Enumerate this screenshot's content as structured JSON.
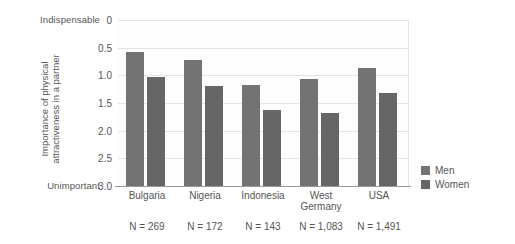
{
  "axis": {
    "top_endcap": "Indispensable",
    "bottom_endcap": "Unimportant",
    "y_title_line1": "Importance of physical",
    "y_title_line2": "attractiveness in a partner",
    "ticks": [
      "3.0",
      "2.5",
      "2.0",
      "1.5",
      "1.0",
      "0.5",
      "0"
    ]
  },
  "legend": {
    "men_label": "Men",
    "women_label": "Women",
    "men_color": "#737373",
    "women_color": "#666666"
  },
  "categories": [
    {
      "name_line1": "Bulgaria",
      "name_line2": "",
      "n": "N = 269"
    },
    {
      "name_line1": "Nigeria",
      "name_line2": "",
      "n": "N = 172"
    },
    {
      "name_line1": "Indonesia",
      "name_line2": "",
      "n": "N = 143"
    },
    {
      "name_line1": "West",
      "name_line2": "Germany",
      "n": "N = 1,083"
    },
    {
      "name_line1": "USA",
      "name_line2": "",
      "n": "N = 1,491"
    }
  ],
  "chart_data": {
    "type": "bar",
    "title": "",
    "xlabel": "",
    "ylabel": "Importance of physical attractiveness in a partner",
    "ylim": [
      0,
      3.0
    ],
    "ytick_values": [
      0,
      0.5,
      1.0,
      1.5,
      2.0,
      2.5,
      3.0
    ],
    "y_axis_endpoint_labels": {
      "min": "Unimportant",
      "max": "Indispensable"
    },
    "grid": true,
    "legend_position": "right",
    "categories": [
      "Bulgaria",
      "Nigeria",
      "Indonesia",
      "West Germany",
      "USA"
    ],
    "sample_sizes": [
      "N = 269",
      "N = 172",
      "N = 143",
      "N = 1,083",
      "N = 1,491"
    ],
    "series": [
      {
        "name": "Men",
        "color": "#737373",
        "values": [
          2.43,
          2.28,
          1.82,
          1.93,
          2.13
        ]
      },
      {
        "name": "Women",
        "color": "#666666",
        "values": [
          1.97,
          1.81,
          1.37,
          1.32,
          1.68
        ]
      }
    ]
  }
}
